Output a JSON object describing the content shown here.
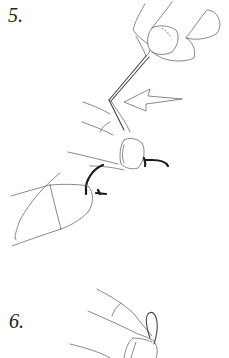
{
  "figure": {
    "type": "instruction-illustration",
    "steps": [
      {
        "label": "5.",
        "content": "fingers holding thread above hook, arrow pointing left toward thread"
      },
      {
        "label": "6.",
        "content": "fingers pinching a thread loop"
      }
    ],
    "colors": {
      "background": "#ffffff",
      "line": "#6b6b6b",
      "hook": "#1a1a1a",
      "label": "#222222"
    }
  }
}
